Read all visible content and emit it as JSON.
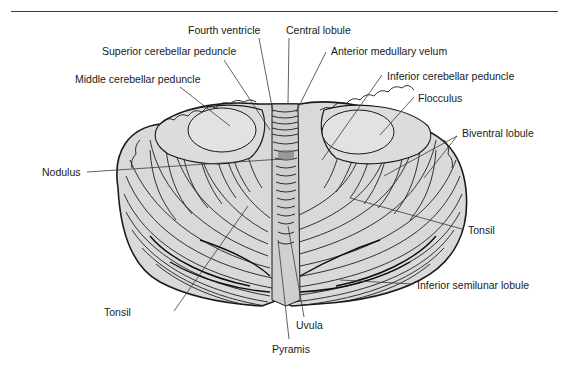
{
  "figure": {
    "colors": {
      "line": "#2a2a2a",
      "fill": "#d9d9d9",
      "dark": "#111111",
      "rule": "#3a3a3a"
    }
  },
  "labels": [
    {
      "id": "fourth-ventricle",
      "text": "Fourth ventricle"
    },
    {
      "id": "central-lobule",
      "text": "Central lobule"
    },
    {
      "id": "superior-cerebellar-peduncle",
      "text": "Superior cerebellar peduncle"
    },
    {
      "id": "anterior-medullary-velum",
      "text": "Anterior medullary velum"
    },
    {
      "id": "middle-cerebellar-peduncle",
      "text": "Middle cerebellar peduncle"
    },
    {
      "id": "inferior-cerebellar-peduncle",
      "text": "Inferior cerebellar peduncle"
    },
    {
      "id": "flocculus",
      "text": "Flocculus"
    },
    {
      "id": "biventral-lobule",
      "text": "Biventral lobule"
    },
    {
      "id": "nodulus",
      "text": "Nodulus"
    },
    {
      "id": "tonsil-right",
      "text": "Tonsil"
    },
    {
      "id": "tonsil-left",
      "text": "Tonsil"
    },
    {
      "id": "inferior-semilunar-lobule",
      "text": "Inferior semilunar lobule"
    },
    {
      "id": "uvula",
      "text": "Uvula"
    },
    {
      "id": "pyramis",
      "text": "Pyramis"
    }
  ]
}
